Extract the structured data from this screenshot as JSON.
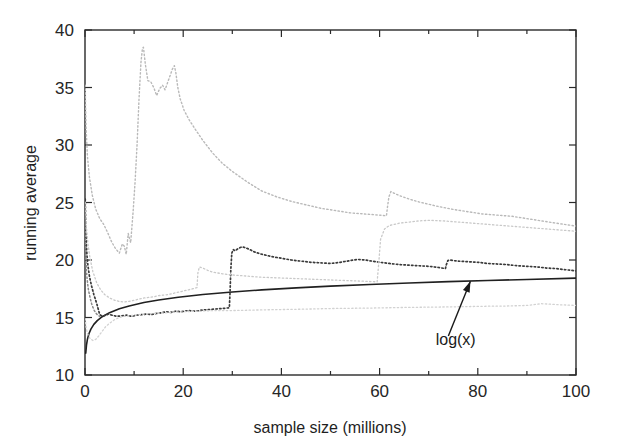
{
  "chart_data": {
    "type": "line",
    "title": "",
    "xlabel": "sample size (millions)",
    "ylabel": "running average",
    "xlim": [
      0,
      100
    ],
    "ylim": [
      10,
      40
    ],
    "xticks": [
      0,
      20,
      40,
      60,
      80,
      100
    ],
    "xtick_labels": [
      "0",
      "20",
      "40",
      "60",
      "80",
      "100"
    ],
    "xminor_step": 10,
    "yticks": [
      10,
      15,
      20,
      25,
      30,
      35,
      40
    ],
    "ytick_labels": [
      "10",
      "15",
      "20",
      "25",
      "30",
      "35",
      "40"
    ],
    "grid": false,
    "legend": "none",
    "annotations": [
      {
        "name": "log-x-annotation",
        "text": "log(x)",
        "text_x": 75.5,
        "text_y": 12.6,
        "arrow_tail_x": 74.0,
        "arrow_tail_y": 13.4,
        "arrow_tip_x": 78.5,
        "arrow_tip_y": 18.15
      }
    ],
    "series": [
      {
        "name": "log(x)",
        "style": "solid",
        "color": "#202020",
        "width": 1.6,
        "x": [
          0.15,
          0.3,
          0.5,
          0.8,
          1.2,
          1.8,
          2.5,
          3.5,
          5,
          7,
          9,
          12,
          15,
          19,
          24,
          30,
          36,
          43,
          50,
          58,
          66,
          74,
          82,
          90,
          100
        ],
        "y": [
          11.9,
          12.6,
          13.12,
          13.59,
          13.99,
          14.4,
          14.73,
          15.07,
          15.42,
          15.76,
          16.0,
          16.3,
          16.52,
          16.76,
          17.0,
          17.22,
          17.4,
          17.58,
          17.73,
          17.87,
          18.0,
          18.12,
          18.22,
          18.31,
          18.42
        ]
      },
      {
        "name": "estimator-dark-stepped",
        "style": "dotted",
        "color": "#3a3a3a",
        "width": 1.7,
        "x": [
          0.05,
          0.1,
          0.15,
          0.2,
          0.3,
          0.4,
          0.6,
          0.9,
          1.3,
          1.8,
          2.4,
          3.0,
          3.6,
          4.2,
          4.8,
          5.5,
          6.5,
          7.5,
          8.5,
          9.5,
          10.5,
          11.5,
          12.5,
          13.5,
          14.5,
          15.5,
          16.5,
          17.5,
          18.5,
          19.5,
          21,
          22.5,
          24,
          25.5,
          27,
          28.5,
          29.4,
          29.55,
          29.7,
          29.9,
          30.2,
          30.6,
          31.2,
          32,
          32.8,
          33.6,
          34.5,
          36,
          38,
          40,
          42,
          44,
          46,
          48,
          50,
          52,
          54,
          55.5,
          57,
          58.5,
          60,
          62,
          64,
          66,
          68,
          70,
          72,
          73.4,
          73.6,
          73.9,
          74.3,
          75,
          76,
          78,
          80,
          82,
          84,
          86,
          88,
          90,
          92,
          94,
          96,
          98,
          100
        ],
        "y": [
          25.3,
          24.2,
          23.1,
          22.2,
          21.2,
          20.4,
          19.5,
          18.6,
          17.8,
          17.0,
          16.2,
          15.25,
          15.1,
          15.2,
          15.3,
          15.2,
          15.1,
          15.15,
          15.2,
          15.1,
          15.2,
          15.25,
          15.3,
          15.25,
          15.35,
          15.4,
          15.5,
          15.45,
          15.55,
          15.5,
          15.6,
          15.55,
          15.65,
          15.7,
          15.75,
          15.8,
          15.85,
          17.3,
          19.2,
          20.6,
          20.9,
          20.8,
          21.0,
          21.15,
          21.05,
          20.9,
          20.7,
          20.5,
          20.3,
          20.15,
          20.0,
          19.9,
          19.8,
          19.75,
          19.7,
          19.8,
          19.95,
          20.05,
          20.0,
          19.9,
          19.8,
          19.7,
          19.6,
          19.55,
          19.5,
          19.45,
          19.35,
          19.25,
          19.6,
          19.95,
          20.0,
          19.95,
          19.9,
          19.85,
          19.8,
          19.7,
          19.65,
          19.6,
          19.5,
          19.45,
          19.4,
          19.3,
          19.25,
          19.15,
          19.05
        ]
      },
      {
        "name": "estimator-light-upper",
        "style": "dotted",
        "color": "#b9b9b9",
        "width": 1.4,
        "x": [
          0.05,
          0.12,
          0.25,
          0.5,
          0.9,
          1.5,
          2.2,
          3.0,
          3.8,
          4.6,
          5.4,
          6.2,
          7.0,
          7.6,
          8.0,
          8.4,
          8.8,
          9.3,
          9.8,
          10.2,
          10.6,
          11.0,
          11.4,
          11.7,
          11.9,
          12.3,
          12.8,
          13.4,
          14.0,
          14.6,
          15.2,
          15.8,
          16.3,
          16.8,
          17.3,
          17.8,
          18.2,
          18.5,
          18.9,
          19.4,
          20.2,
          21.2,
          22.4,
          24,
          26,
          28,
          30,
          33,
          36,
          39,
          42,
          45,
          48,
          51,
          54,
          57,
          60,
          61.4,
          61.6,
          61.9,
          62.3,
          63,
          64,
          66,
          68,
          70,
          72,
          75,
          78,
          81,
          84,
          87,
          90,
          93,
          96,
          100
        ],
        "y": [
          35.2,
          33.4,
          31.2,
          29.0,
          27.2,
          25.6,
          24.4,
          23.6,
          23.1,
          22.4,
          21.6,
          21.0,
          20.6,
          21.4,
          21.2,
          20.5,
          22.3,
          21.5,
          24.2,
          26.8,
          30.0,
          34.0,
          37.2,
          38.4,
          38.5,
          37.0,
          35.6,
          35.5,
          35.0,
          34.3,
          34.9,
          35.2,
          34.8,
          35.4,
          36.0,
          36.6,
          36.9,
          36.3,
          35.0,
          34.0,
          33.0,
          32.2,
          31.4,
          30.4,
          29.3,
          28.4,
          27.7,
          26.8,
          26.0,
          25.5,
          25.1,
          24.8,
          24.5,
          24.3,
          24.1,
          24.0,
          23.9,
          23.85,
          24.6,
          25.5,
          25.95,
          25.8,
          25.6,
          25.3,
          25.05,
          24.85,
          24.65,
          24.4,
          24.2,
          24.0,
          23.9,
          23.8,
          23.6,
          23.4,
          23.2,
          22.95
        ]
      },
      {
        "name": "estimator-light-middle",
        "style": "dotted",
        "color": "#c9c9c9",
        "width": 1.3,
        "x": [
          0.05,
          0.15,
          0.3,
          0.6,
          1.0,
          1.6,
          2.4,
          3.2,
          4.0,
          5.0,
          6.0,
          7.0,
          8.0,
          9.0,
          10,
          11,
          12,
          13,
          14,
          15,
          16,
          17,
          18,
          19,
          20,
          21,
          22,
          22.8,
          23.0,
          23.3,
          24,
          25,
          26,
          28,
          30,
          33,
          36,
          39,
          42,
          45,
          48,
          51,
          54,
          57,
          59.5,
          59.8,
          60.2,
          61,
          62,
          64,
          66,
          68,
          70,
          73,
          76,
          79,
          82,
          85,
          88,
          91,
          94,
          97,
          100
        ],
        "y": [
          25.0,
          24.0,
          22.8,
          21.4,
          20.2,
          19.0,
          18.0,
          17.4,
          17.0,
          16.7,
          16.5,
          16.4,
          16.35,
          16.4,
          16.5,
          16.6,
          16.7,
          16.75,
          16.8,
          16.9,
          16.95,
          17.0,
          17.1,
          17.2,
          17.3,
          17.4,
          17.5,
          17.6,
          18.9,
          19.4,
          19.3,
          19.1,
          18.95,
          18.8,
          18.7,
          18.6,
          18.5,
          18.45,
          18.4,
          18.35,
          18.3,
          18.25,
          18.2,
          18.15,
          18.1,
          19.6,
          21.8,
          22.7,
          23.0,
          23.2,
          23.3,
          23.4,
          23.45,
          23.4,
          23.3,
          23.2,
          23.1,
          23.0,
          22.9,
          22.8,
          22.7,
          22.6,
          22.5
        ]
      },
      {
        "name": "estimator-light-lower",
        "style": "dotted",
        "color": "#d2d2d2",
        "width": 1.3,
        "x": [
          0.05,
          0.2,
          0.5,
          1.0,
          1.6,
          2.2,
          2.8,
          3.5,
          4.2,
          5,
          6,
          7,
          8,
          10,
          12,
          14,
          16,
          18,
          20,
          23,
          26,
          29,
          32,
          35,
          38,
          41,
          44,
          47,
          50,
          54,
          58,
          62,
          66,
          70,
          74,
          78,
          82,
          86,
          90,
          93,
          95,
          97,
          100
        ],
        "y": [
          14.9,
          14.2,
          13.6,
          13.2,
          13.0,
          13.1,
          13.4,
          13.8,
          14.2,
          14.5,
          14.8,
          15.0,
          15.1,
          15.2,
          15.3,
          15.35,
          15.4,
          15.45,
          15.5,
          15.55,
          15.6,
          15.6,
          15.62,
          15.65,
          15.68,
          15.7,
          15.72,
          15.75,
          15.78,
          15.8,
          15.82,
          15.85,
          15.88,
          15.9,
          15.92,
          15.95,
          15.98,
          16.0,
          16.05,
          16.2,
          16.15,
          16.1,
          16.05
        ]
      },
      {
        "name": "initial-transient-burst",
        "style": "dotted",
        "color": "#8a8a8a",
        "width": 1.5,
        "x": [
          0.02,
          0.03,
          0.04,
          0.05,
          0.07,
          0.09,
          0.12,
          0.15,
          0.2,
          0.26,
          0.33,
          0.42,
          0.55,
          0.7,
          0.9,
          1.1,
          1.35,
          1.6,
          1.9,
          2.2,
          2.6,
          3.0
        ],
        "y": [
          24.8,
          24.2,
          23.6,
          23.0,
          22.4,
          21.8,
          21.2,
          20.6,
          20.0,
          19.4,
          18.9,
          18.4,
          17.9,
          17.4,
          17.0,
          16.6,
          16.2,
          15.9,
          15.6,
          15.4,
          15.2,
          15.1
        ]
      }
    ]
  }
}
